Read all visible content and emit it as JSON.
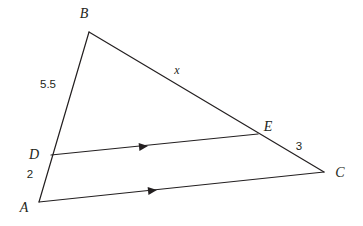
{
  "figure": {
    "background_color": "#ffffff",
    "stroke_color": "#231f20",
    "stroke_width": 1.2
  },
  "points": {
    "A": {
      "label": "A",
      "x": 39,
      "y": 202,
      "label_x": 24,
      "label_y": 212
    },
    "B": {
      "label": "B",
      "x": 89,
      "y": 32,
      "label_x": 84,
      "label_y": 18
    },
    "C": {
      "label": "C",
      "x": 324,
      "y": 172,
      "label_x": 340,
      "label_y": 177
    },
    "D": {
      "label": "D",
      "x": 51,
      "y": 155,
      "label_x": 34,
      "label_y": 159
    },
    "E": {
      "label": "E",
      "x": 258,
      "y": 134,
      "label_x": 268,
      "label_y": 131
    }
  },
  "segments": [
    {
      "name": "segment-AB",
      "from": "A",
      "to": "B"
    },
    {
      "name": "segment-BC",
      "from": "B",
      "to": "C"
    },
    {
      "name": "segment-AC",
      "from": "A",
      "to": "C"
    },
    {
      "name": "segment-DE",
      "from": "D",
      "to": "E"
    }
  ],
  "measures": {
    "BD": {
      "text": "5.5",
      "x": 48,
      "y": 88,
      "segment": "segment-BD"
    },
    "DA": {
      "text": "2",
      "x": 30,
      "y": 178,
      "segment": "segment-DA"
    },
    "EC": {
      "text": "3",
      "x": 299,
      "y": 150,
      "segment": "segment-EC"
    },
    "BE": {
      "text": "x",
      "x": 177,
      "y": 74,
      "segment": "segment-BE"
    }
  },
  "parallel_marks": [
    {
      "name": "arrow-mark-DE",
      "x": 143,
      "y": 146.4,
      "angle": -5.8,
      "on": "segment-DE"
    },
    {
      "name": "arrow-mark-AC",
      "x": 152,
      "y": 190.1,
      "angle": -6.0,
      "on": "segment-AC"
    }
  ]
}
